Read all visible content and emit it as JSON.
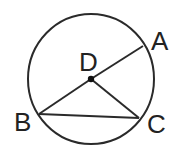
{
  "diagram": {
    "type": "circle-geometry",
    "stroke_color": "#2a2a2a",
    "circle": {
      "center": "D",
      "cx": 91,
      "cy": 79,
      "rx": 63,
      "ry": 65
    },
    "points": {
      "D": {
        "label": "D",
        "x": 91,
        "y": 79,
        "label_x": 79,
        "label_y": 71
      },
      "A": {
        "label": "A",
        "x": 143,
        "y": 46,
        "label_x": 151,
        "label_y": 50
      },
      "B": {
        "label": "B",
        "x": 39,
        "y": 114,
        "label_x": 14,
        "label_y": 131
      },
      "C": {
        "label": "C",
        "x": 139,
        "y": 118,
        "label_x": 147,
        "label_y": 133
      }
    },
    "segments": [
      {
        "from": "A",
        "to": "D"
      },
      {
        "from": "D",
        "to": "B"
      },
      {
        "from": "D",
        "to": "C"
      },
      {
        "from": "B",
        "to": "C"
      }
    ]
  }
}
